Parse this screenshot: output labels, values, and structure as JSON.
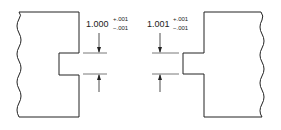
{
  "diagram": {
    "left_part": {
      "nominal": "1.000",
      "tol_plus": "+.001",
      "tol_minus": "−.001"
    },
    "right_part": {
      "nominal": "1.001",
      "tol_plus": "+.001",
      "tol_minus": "−.001"
    },
    "colors": {
      "line": "#222222",
      "extension": "#555555"
    }
  }
}
